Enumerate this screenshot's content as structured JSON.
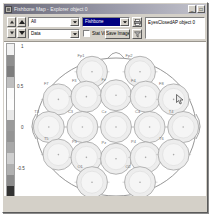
{
  "window": {
    "title": "Fishbone Map - Explorer object 0",
    "icon": "map-window-icon",
    "buttons": [
      {
        "name": "minimize",
        "glyph": "_"
      },
      {
        "name": "maximize",
        "glyph": "□"
      }
    ]
  },
  "toolbar": {
    "spinners": [
      {
        "name": "frame-step-up",
        "icon": "triangle-up-icon"
      },
      {
        "name": "frame-page-up",
        "icon": "triangle-up-large-icon"
      },
      {
        "name": "frame-step-down",
        "icon": "triangle-down-icon"
      },
      {
        "name": "frame-page-down",
        "icon": "triangle-down-large-icon"
      }
    ],
    "combo_channel": {
      "value": "All",
      "placeholder": "All"
    },
    "combo_source": {
      "value": "Data",
      "placeholder": "Data"
    },
    "combo_view": {
      "value": "Fishbone",
      "placeholder": "Fishbone"
    },
    "checkbox_statview": {
      "label": "Stat View",
      "checked": false
    },
    "save_image_label": "Save Image",
    "icon_buttons": [
      {
        "name": "print-icon",
        "glyph": "⎙"
      },
      {
        "name": "filter-icon",
        "glyph": "∇"
      }
    ],
    "info_text": "EyesClosedAP object 0"
  },
  "plot": {
    "colorbar": {
      "name": "grayscale-colorbar",
      "bands": [
        "#f2f2f2",
        "#8f8f8f",
        "#7d7d7d",
        "#bfbfbf",
        "#fbfbfb",
        "#fdfdfd",
        "#e8e8e8",
        "#9a9a9a",
        "#949494",
        "#a8a8a8",
        "#cfcfcf",
        "#b0b0b0",
        "#8c8c8c",
        "#333333",
        "#1c1c1c"
      ]
    },
    "axis_ticks": [
      "1",
      "0.5",
      "0",
      "-0.5",
      "-1"
    ],
    "cursor": {
      "name": "mouse-pointer",
      "x": 172,
      "y": 52
    }
  },
  "chart_data": {
    "type": "scatter",
    "xlabel": "",
    "ylabel": "",
    "xlim": [
      -1,
      1
    ],
    "ylim": [
      -1,
      1
    ],
    "grid": false,
    "legend": "none",
    "colorbar_label": "",
    "electrodes": [
      {
        "label": "Fp1",
        "x": -0.3,
        "y": 0.8
      },
      {
        "label": "Fp2",
        "x": 0.3,
        "y": 0.8
      },
      {
        "label": "F7",
        "x": -0.72,
        "y": 0.4
      },
      {
        "label": "F3",
        "x": -0.37,
        "y": 0.44
      },
      {
        "label": "Fz",
        "x": 0.0,
        "y": 0.46
      },
      {
        "label": "F4",
        "x": 0.37,
        "y": 0.44
      },
      {
        "label": "F8",
        "x": 0.72,
        "y": 0.4
      },
      {
        "label": "T3",
        "x": -0.84,
        "y": 0.0
      },
      {
        "label": "C3",
        "x": -0.42,
        "y": 0.0
      },
      {
        "label": "Cz",
        "x": 0.0,
        "y": 0.0
      },
      {
        "label": "C4",
        "x": 0.42,
        "y": 0.0
      },
      {
        "label": "T4",
        "x": 0.84,
        "y": 0.0
      },
      {
        "label": "T5",
        "x": -0.72,
        "y": -0.4
      },
      {
        "label": "P3",
        "x": -0.37,
        "y": -0.44
      },
      {
        "label": "Pz",
        "x": 0.0,
        "y": -0.46
      },
      {
        "label": "P4",
        "x": 0.37,
        "y": -0.44
      },
      {
        "label": "T6",
        "x": 0.72,
        "y": -0.4
      },
      {
        "label": "O1",
        "x": -0.3,
        "y": -0.8
      },
      {
        "label": "O2",
        "x": 0.3,
        "y": -0.8
      }
    ]
  }
}
